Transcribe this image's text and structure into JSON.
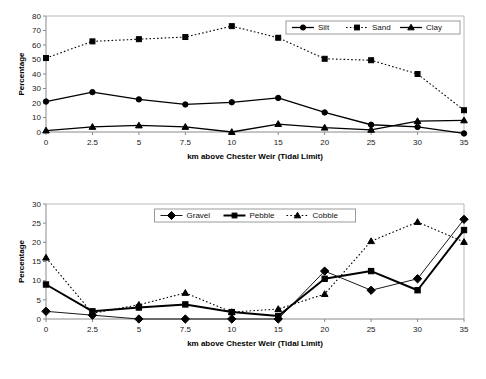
{
  "chart_data": [
    {
      "type": "line",
      "chart_id": "sediment-fines-top",
      "title": "",
      "xlabel": "km above Chester Weir (Tidal Limit)",
      "ylabel": "Percentage",
      "x": [
        0,
        2.5,
        5,
        7.5,
        10,
        15,
        20,
        25,
        30,
        35
      ],
      "xtick_labels": [
        "0",
        "2.5",
        "5",
        "7.5",
        "10",
        "15",
        "20",
        "25",
        "30",
        "35"
      ],
      "ytick_labels": [
        "0",
        "10",
        "20",
        "30",
        "40",
        "50",
        "60",
        "70",
        "80"
      ],
      "ylim": [
        0,
        80
      ],
      "ytick_step": 10,
      "grid": false,
      "legend_position": "top-right",
      "series": [
        {
          "name": "Silt",
          "marker": "circle",
          "line_style": "solid",
          "color": "#000000",
          "values": [
            21,
            27.5,
            22.5,
            19,
            20.5,
            23.5,
            13.5,
            5,
            3.5,
            -1
          ]
        },
        {
          "name": "Sand",
          "marker": "square",
          "line_style": "dotted",
          "color": "#000000",
          "values": [
            51,
            62.5,
            64,
            65.5,
            73,
            65,
            50.5,
            49.5,
            40,
            15
          ]
        },
        {
          "name": "Clay",
          "marker": "triangle",
          "line_style": "solid",
          "color": "#000000",
          "values": [
            1,
            3.5,
            4.5,
            3.5,
            0,
            5.5,
            3,
            1.5,
            7.5,
            8
          ]
        }
      ]
    },
    {
      "type": "line",
      "chart_id": "sediment-coarse-bottom",
      "title": "",
      "xlabel": "km above Chester Weir (Tidal Limit)",
      "ylabel": "Percentage",
      "x": [
        0,
        2.5,
        5,
        7.5,
        10,
        15,
        20,
        25,
        30,
        35
      ],
      "xtick_labels": [
        "0",
        "2.5",
        "5",
        "7.5",
        "10",
        "15",
        "20",
        "25",
        "30",
        "35"
      ],
      "ytick_labels": [
        "0",
        "5",
        "10",
        "15",
        "20",
        "25",
        "30"
      ],
      "ylim": [
        0,
        30
      ],
      "ytick_step": 5,
      "grid": false,
      "legend_position": "top-center",
      "series": [
        {
          "name": "Gravel",
          "marker": "diamond",
          "line_style": "thin",
          "color": "#000000",
          "values": [
            2,
            1,
            0,
            0,
            0,
            0,
            12.5,
            7.5,
            10.5,
            26
          ]
        },
        {
          "name": "Pebble",
          "marker": "square",
          "line_style": "bold-solid",
          "color": "#000000",
          "values": [
            9,
            2,
            3,
            3.8,
            1.8,
            0.8,
            10.5,
            12.5,
            7.5,
            23.2
          ]
        },
        {
          "name": "Cobble",
          "marker": "triangle",
          "line_style": "dotted",
          "color": "#000000",
          "values": [
            16,
            1.5,
            3.7,
            6.8,
            1.8,
            2.6,
            6.5,
            20.3,
            25.3,
            20.1
          ]
        }
      ]
    }
  ]
}
